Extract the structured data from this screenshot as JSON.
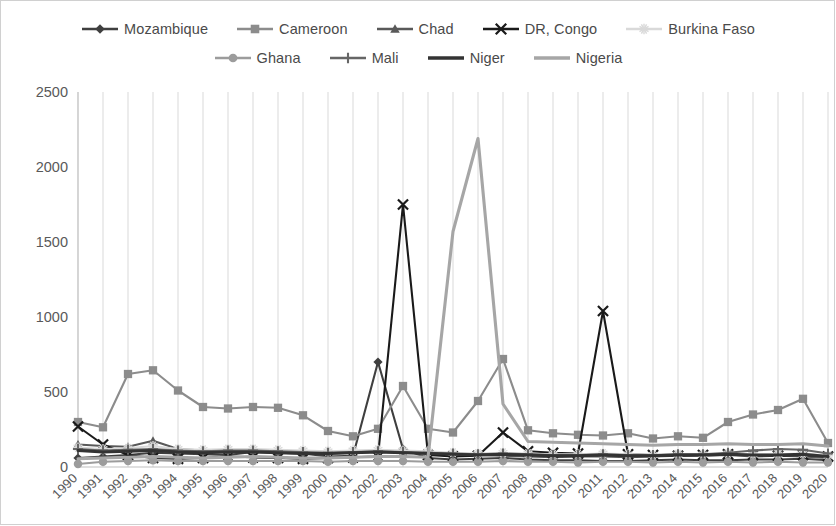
{
  "chart_data": {
    "type": "line",
    "title": "",
    "xlabel": "",
    "ylabel": "",
    "ylim": [
      0,
      2500
    ],
    "yticks": [
      0,
      500,
      1000,
      1500,
      2000,
      2500
    ],
    "grid": "vertical",
    "legend_position": "top",
    "categories": [
      "1990",
      "1991",
      "1992",
      "1993",
      "1994",
      "1995",
      "1996",
      "1997",
      "1998",
      "1999",
      "2000",
      "2001",
      "2002",
      "2003",
      "2004",
      "2005",
      "2006",
      "2007",
      "2008",
      "2009",
      "2010",
      "2011",
      "2012",
      "2013",
      "2014",
      "2015",
      "2016",
      "2017",
      "2018",
      "2019",
      "2020"
    ],
    "series": [
      {
        "name": "Mozambique",
        "color": "#3f3f3f",
        "marker": "diamond",
        "values": [
          60,
          70,
          80,
          95,
          90,
          85,
          80,
          100,
          95,
          90,
          70,
          75,
          700,
          120,
          60,
          50,
          55,
          60,
          50,
          45,
          45,
          40,
          40,
          45,
          50,
          45,
          45,
          50,
          50,
          55,
          45
        ]
      },
      {
        "name": "Cameroon",
        "color": "#8c8c8c",
        "marker": "square",
        "values": [
          300,
          265,
          620,
          645,
          510,
          400,
          390,
          400,
          395,
          345,
          240,
          205,
          255,
          540,
          255,
          230,
          440,
          720,
          245,
          225,
          215,
          210,
          225,
          190,
          205,
          195,
          300,
          350,
          380,
          455,
          160
        ]
      },
      {
        "name": "Chad",
        "color": "#595959",
        "marker": "triangle",
        "values": [
          150,
          140,
          135,
          175,
          120,
          110,
          115,
          105,
          100,
          95,
          90,
          95,
          100,
          95,
          90,
          85,
          80,
          75,
          70,
          65,
          70,
          70,
          65,
          70,
          75,
          75,
          80,
          70,
          75,
          70,
          60
        ]
      },
      {
        "name": "DR, Congo",
        "color": "#1a1a1a",
        "marker": "x",
        "values": [
          270,
          150,
          80,
          60,
          55,
          60,
          70,
          65,
          60,
          55,
          60,
          65,
          70,
          1750,
          80,
          70,
          75,
          230,
          105,
          95,
          90,
          1040,
          85,
          80,
          75,
          80,
          85,
          80,
          75,
          80,
          70
        ]
      },
      {
        "name": "Burkina Faso",
        "color": "#d9d9d9",
        "marker": "star",
        "values": [
          130,
          120,
          125,
          140,
          120,
          115,
          120,
          120,
          115,
          110,
          105,
          110,
          115,
          110,
          105,
          95,
          90,
          95,
          90,
          85,
          85,
          90,
          85,
          80,
          85,
          85,
          90,
          85,
          85,
          90,
          75
        ]
      },
      {
        "name": "Ghana",
        "color": "#9c9c9c",
        "marker": "circle",
        "values": [
          20,
          35,
          40,
          45,
          40,
          40,
          40,
          40,
          40,
          40,
          35,
          40,
          40,
          40,
          35,
          35,
          35,
          40,
          35,
          35,
          30,
          35,
          35,
          30,
          35,
          30,
          35,
          30,
          35,
          30,
          30
        ]
      },
      {
        "name": "Mali",
        "color": "#666666",
        "marker": "plus",
        "values": [
          120,
          110,
          115,
          120,
          110,
          105,
          110,
          110,
          105,
          100,
          95,
          100,
          105,
          100,
          95,
          90,
          85,
          90,
          85,
          80,
          80,
          85,
          80,
          80,
          85,
          85,
          95,
          110,
          120,
          115,
          90
        ]
      },
      {
        "name": "Niger",
        "color": "#333333",
        "marker": "none",
        "values": [
          110,
          100,
          105,
          110,
          100,
          95,
          100,
          100,
          95,
          90,
          90,
          95,
          100,
          95,
          90,
          85,
          80,
          85,
          80,
          75,
          75,
          80,
          75,
          75,
          80,
          80,
          85,
          80,
          80,
          85,
          70
        ]
      },
      {
        "name": "Nigeria",
        "color": "#a6a6a6",
        "marker": "none",
        "values": [
          55,
          60,
          65,
          70,
          65,
          60,
          65,
          70,
          65,
          60,
          60,
          65,
          70,
          70,
          65,
          1570,
          2190,
          420,
          170,
          165,
          160,
          155,
          150,
          145,
          150,
          150,
          155,
          150,
          150,
          155,
          140
        ]
      }
    ]
  }
}
